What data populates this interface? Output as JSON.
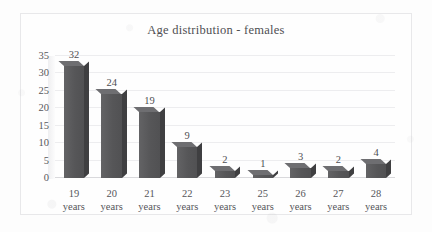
{
  "chart_data": {
    "type": "bar",
    "title": "Age distribution - females",
    "xlabel": "",
    "ylabel": "",
    "categories": [
      "19 years",
      "20 years",
      "21 years",
      "22 years",
      "23 years",
      "25 years",
      "26 years",
      "27 years",
      "28 years"
    ],
    "category_lines": [
      [
        "19",
        "years"
      ],
      [
        "20",
        "years"
      ],
      [
        "21",
        "years"
      ],
      [
        "22",
        "years"
      ],
      [
        "23",
        "years"
      ],
      [
        "25",
        "years"
      ],
      [
        "26",
        "years"
      ],
      [
        "27",
        "years"
      ],
      [
        "28",
        "years"
      ]
    ],
    "values": [
      32,
      24,
      19,
      9,
      2,
      1,
      3,
      2,
      4
    ],
    "data_labels": [
      "32",
      "24",
      "19",
      "9",
      "2",
      "1",
      "3",
      "2",
      "4"
    ],
    "ylim": [
      0,
      35
    ],
    "ytick_values": [
      0,
      5,
      10,
      15,
      20,
      25,
      30,
      35
    ],
    "ytick_labels": [
      "0",
      "5",
      "10",
      "15",
      "20",
      "25",
      "30",
      "35"
    ],
    "grid": true,
    "grid_orientation": "horizontal",
    "legend": false,
    "legend_position": "none",
    "style": "3d-column",
    "colors": {
      "bar_front": "#5b5b5d",
      "bar_side": "#3f3f41",
      "bar_top": "#6e6e71",
      "gridline": "#ededef",
      "axis": "#d9d9dc",
      "text": "#4f4f53",
      "title": "#4e4e52",
      "frame_border": "#e8e8ea",
      "background": "#fefefe"
    }
  }
}
